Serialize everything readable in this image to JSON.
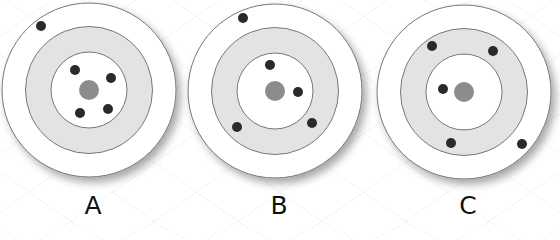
{
  "figure": {
    "colors": {
      "ring_outer": "#ffffff",
      "ring_middle": "#e3e3e3",
      "ring_inner": "#ffffff",
      "bullseye": "#8c8c8c",
      "ring_stroke": "#777777",
      "dot": "#2a2a2a"
    },
    "targets": [
      {
        "label": "A",
        "cx": 89,
        "cy": 90,
        "label_x": 93,
        "label_y": 193,
        "dots": [
          [
            41,
            26
          ],
          [
            75,
            70
          ],
          [
            111,
            78
          ],
          [
            80,
            113
          ],
          [
            108,
            109
          ]
        ]
      },
      {
        "label": "B",
        "cx": 275,
        "cy": 91,
        "label_x": 279,
        "label_y": 193,
        "dots": [
          [
            243,
            18
          ],
          [
            270,
            65
          ],
          [
            298,
            92
          ],
          [
            237,
            127
          ],
          [
            312,
            123
          ]
        ]
      },
      {
        "label": "C",
        "cx": 464,
        "cy": 92,
        "label_x": 468,
        "label_y": 193,
        "dots": [
          [
            432,
            46
          ],
          [
            493,
            51
          ],
          [
            443,
            89
          ],
          [
            451,
            143
          ],
          [
            522,
            144
          ]
        ]
      }
    ],
    "radii": {
      "outer": 87,
      "middle": 63.5,
      "inner": 38,
      "bullseye": 10,
      "dot": 5
    }
  }
}
